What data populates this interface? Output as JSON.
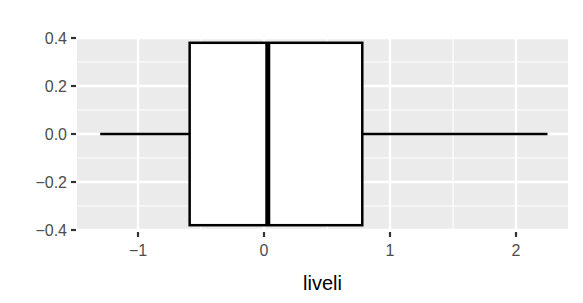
{
  "chart_data": {
    "type": "boxplot",
    "orientation": "horizontal",
    "title": "",
    "xlabel": "liveli",
    "ylabel": "",
    "xlim": [
      -1.5,
      2.4
    ],
    "ylim": [
      -0.4,
      0.4
    ],
    "x_ticks": [
      -1,
      0,
      1,
      2
    ],
    "x_tick_labels": [
      "−1",
      "0",
      "1",
      "2"
    ],
    "y_ticks": [
      0.4,
      0.2,
      0.0,
      -0.2,
      -0.4
    ],
    "y_tick_labels": [
      "0.4",
      "0.2",
      "0.0",
      "−0.2",
      "−0.4"
    ],
    "grid": true,
    "legend": null,
    "box": {
      "lower_whisker": -1.3,
      "q1": -0.59,
      "median": 0.03,
      "q3": 0.78,
      "upper_whisker": 2.25,
      "y_center": 0.0,
      "half_height": 0.38
    },
    "colors": {
      "panel_background": "#ebebeb",
      "grid_line": "#ffffff",
      "box_fill": "#ffffff",
      "box_stroke": "#000000",
      "tick_label": "#4d4d4d",
      "tick_mark": "#333333"
    }
  }
}
